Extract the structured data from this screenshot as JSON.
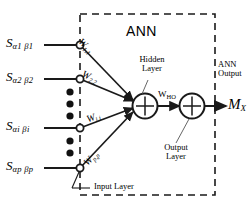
{
  "figure": {
    "title": "ANN",
    "box_label": "ANN",
    "output_label_line1": "ANN",
    "output_label_line2": "Output",
    "hidden_layer_line1": "Hidden",
    "hidden_layer_line2": "Layer",
    "output_layer_line1": "Output",
    "output_layer_line2": "Layer",
    "input_layer_label": "Input Layer",
    "output_symbol": "M",
    "output_symbol_sub": "X",
    "line_color": "#1a1a1a",
    "box_color": "#1a1a1a",
    "background": "#ffffff"
  },
  "inputs": [
    {
      "name": "S",
      "sub": "α1 β1"
    },
    {
      "name": "S",
      "sub": "α2 β2"
    },
    {
      "name": "S",
      "sub": "αi βi"
    },
    {
      "name": "S",
      "sub": "αp βp"
    }
  ],
  "weights": [
    {
      "name": "W",
      "sub": "1,1"
    },
    {
      "name": "W",
      "sub": "2,2"
    },
    {
      "name": "W",
      "sub": "i,i"
    },
    {
      "name": "W",
      "sub": "p,p"
    }
  ],
  "hidden_to_output_weight": {
    "name": "W",
    "sub": "HO"
  },
  "ellipsis_dots": 5,
  "nodes": {
    "hidden_neuron": "Σ",
    "output_neuron": "Σ"
  }
}
